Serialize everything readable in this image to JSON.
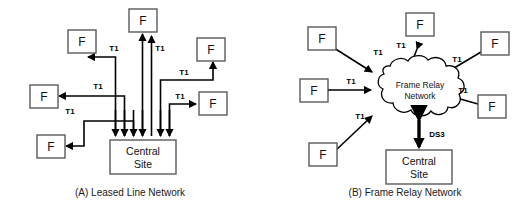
{
  "figure": {
    "background_color": "#ffffff",
    "line_color": "#000000",
    "box_stroke_color": "#5a5a5a"
  },
  "panel_a": {
    "caption": "(A) Leased Line Network",
    "hub": {
      "label_line1": "Central",
      "label_line2": "Site"
    },
    "remote_label": "F",
    "link_label": "T1",
    "remote_count": 6,
    "links": [
      {
        "id": "a-link-1",
        "label": "T1",
        "direction": "hub-to-remote"
      },
      {
        "id": "a-link-2",
        "label": "T1",
        "direction": "hub-to-remote"
      },
      {
        "id": "a-link-3",
        "label": "T1",
        "direction": "hub-to-remote"
      },
      {
        "id": "a-link-4",
        "label": "T1",
        "direction": "hub-to-remote"
      },
      {
        "id": "a-link-5",
        "label": "T1",
        "direction": "hub-to-remote"
      },
      {
        "id": "a-link-6",
        "label": "T1",
        "direction": "hub-to-remote"
      }
    ]
  },
  "panel_b": {
    "caption": "(B) Frame Relay Network",
    "cloud": {
      "label_line1": "Frame Relay",
      "label_line2": "Network"
    },
    "hub": {
      "label_line1": "Central",
      "label_line2": "Site"
    },
    "remote_label": "F",
    "link_label": "T1",
    "trunk_label": "DS3",
    "remote_count": 6,
    "links": [
      {
        "id": "b-link-1",
        "label": "T1",
        "direction": "bidirectional"
      },
      {
        "id": "b-link-2",
        "label": "T1",
        "direction": "bidirectional"
      },
      {
        "id": "b-link-3",
        "label": "T1",
        "direction": "bidirectional"
      },
      {
        "id": "b-link-4",
        "label": "T1",
        "direction": "bidirectional"
      },
      {
        "id": "b-link-5",
        "label": "T1",
        "direction": "bidirectional"
      },
      {
        "id": "b-link-6",
        "label": "T1",
        "direction": "bidirectional"
      },
      {
        "id": "b-trunk",
        "label": "DS3",
        "direction": "bidirectional"
      }
    ]
  }
}
